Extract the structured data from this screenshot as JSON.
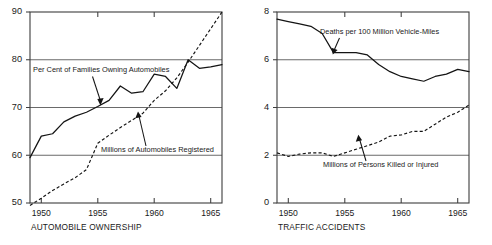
{
  "figure": {
    "background_color": "#ffffff",
    "ink_color": "#141414",
    "grid_color": "#6a6a6a"
  },
  "charts": [
    {
      "id": "automobile-ownership",
      "axis_title": "AUTOMOBILE OWNERSHIP",
      "ytick_labels": [
        "90",
        "80",
        "70",
        "60",
        "50"
      ],
      "xtick_labels": [
        "1950",
        "1955",
        "1960",
        "1965"
      ],
      "annotations": [
        {
          "id": "pct-families",
          "text": "Per Cent of Families Owning Automobiles"
        },
        {
          "id": "millions-registered",
          "text": "Millions of Automobiles Registered"
        }
      ]
    },
    {
      "id": "traffic-accidents",
      "axis_title": "TRAFFIC ACCIDENTS",
      "ytick_labels": [
        "8",
        "6",
        "4",
        "2",
        "0"
      ],
      "xtick_labels": [
        "1950",
        "1955",
        "1960",
        "1965"
      ],
      "annotations": [
        {
          "id": "deaths-per-100m",
          "text": "Deaths per 100 Million Vehicle-Miles"
        },
        {
          "id": "millions-killed-injured",
          "text": "Millions of Persons Killed or Injured"
        }
      ]
    }
  ],
  "chart_data": [
    {
      "type": "line",
      "title": "AUTOMOBILE OWNERSHIP",
      "xlabel": "",
      "ylabel": "",
      "xlim": [
        1949,
        1966
      ],
      "ylim": [
        50,
        90
      ],
      "yticks": [
        50,
        60,
        70,
        80,
        90
      ],
      "xticks": [
        1950,
        1955,
        1960,
        1965
      ],
      "grid": true,
      "grid_lines_at": [
        60,
        70,
        80
      ],
      "legend": "inline-annotations",
      "x": [
        1949,
        1950,
        1951,
        1952,
        1953,
        1954,
        1955,
        1956,
        1957,
        1958,
        1959,
        1960,
        1961,
        1962,
        1963,
        1964,
        1965,
        1966
      ],
      "series": [
        {
          "name": "Per Cent of Families Owning Automobiles",
          "style": "solid",
          "values": [
            59.5,
            64.0,
            64.5,
            67.0,
            68.2,
            69.0,
            70.2,
            71.5,
            74.5,
            73.0,
            73.3,
            77.0,
            76.5,
            74.0,
            80.0,
            78.2,
            78.5,
            79.0
          ]
        },
        {
          "name": "Millions of Automobiles Registered",
          "style": "dashed",
          "values": [
            49.5,
            51.0,
            52.6,
            54.0,
            55.3,
            57.0,
            62.5,
            64.2,
            65.8,
            67.3,
            68.8,
            71.5,
            73.5,
            76.2,
            79.5,
            83.0,
            86.5,
            90.0
          ]
        }
      ]
    },
    {
      "type": "line",
      "title": "TRAFFIC ACCIDENTS",
      "xlabel": "",
      "ylabel": "",
      "xlim": [
        1949,
        1966
      ],
      "ylim": [
        0,
        8
      ],
      "yticks": [
        0,
        2,
        4,
        6,
        8
      ],
      "xticks": [
        1950,
        1955,
        1960,
        1965
      ],
      "grid": true,
      "grid_lines_at": [
        2,
        4,
        6
      ],
      "legend": "inline-annotations",
      "x": [
        1949,
        1950,
        1951,
        1952,
        1953,
        1954,
        1955,
        1956,
        1957,
        1958,
        1959,
        1960,
        1961,
        1962,
        1963,
        1964,
        1965,
        1966
      ],
      "series": [
        {
          "name": "Deaths per 100 Million Vehicle-Miles",
          "style": "solid",
          "values": [
            7.7,
            7.6,
            7.5,
            7.4,
            7.1,
            6.3,
            6.3,
            6.3,
            6.2,
            5.8,
            5.5,
            5.3,
            5.2,
            5.1,
            5.3,
            5.4,
            5.6,
            5.5
          ]
        },
        {
          "name": "Millions of Persons Killed or Injured",
          "style": "dashed",
          "values": [
            2.1,
            1.95,
            2.05,
            2.1,
            2.1,
            1.95,
            2.1,
            2.25,
            2.4,
            2.55,
            2.8,
            2.85,
            3.0,
            3.0,
            3.3,
            3.6,
            3.8,
            4.1
          ]
        }
      ]
    }
  ]
}
